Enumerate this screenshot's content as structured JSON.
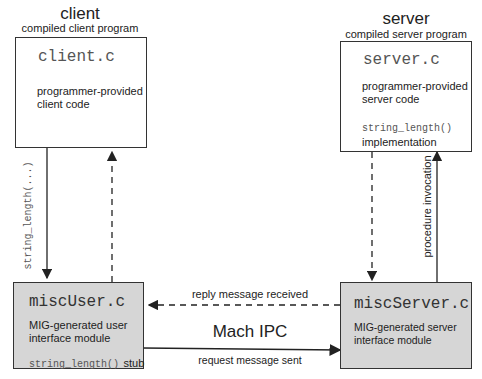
{
  "client": {
    "title": "client",
    "subtitle": "compiled client program",
    "file": "client.c",
    "desc_line1": "programmer-provided",
    "desc_line2": "client code"
  },
  "server": {
    "title": "server",
    "subtitle": "compiled server program",
    "file": "server.c",
    "desc_line1": "programmer-provided",
    "desc_line2": "server code",
    "impl_code": "string_length()",
    "impl_label": "implementation"
  },
  "misc_user": {
    "file": "miscUser.c",
    "desc_line1": "MIG-generated user",
    "desc_line2": "interface module",
    "stub_code": "string_length()",
    "stub_label": "stub"
  },
  "misc_server": {
    "file": "miscServer.c",
    "desc_line1": "MIG-generated server",
    "desc_line2": "interface module"
  },
  "arrows": {
    "client_call": "string_length(...)",
    "procedure_invocation": "procedure invocation",
    "reply": "reply message received",
    "request": "request message sent",
    "ipc_label": "Mach IPC"
  }
}
